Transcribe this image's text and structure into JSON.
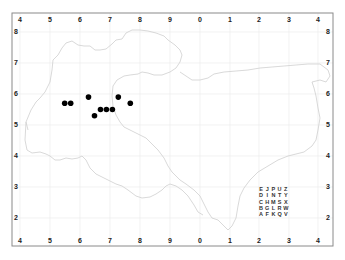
{
  "map": {
    "x_ticks": [
      "4",
      "5",
      "6",
      "7",
      "8",
      "9",
      "0",
      "1",
      "2",
      "3",
      "4"
    ],
    "y_ticks": [
      "8",
      "7",
      "6",
      "5",
      "4",
      "3",
      "2"
    ],
    "colors": {
      "frame": "#8a8a8a",
      "grid": "#ececec",
      "coastline": "#cfcfcf",
      "points": "#000000"
    },
    "points": [
      {
        "x": 5.5,
        "y": 5.7
      },
      {
        "x": 5.7,
        "y": 5.7
      },
      {
        "x": 6.3,
        "y": 5.9
      },
      {
        "x": 6.5,
        "y": 5.3
      },
      {
        "x": 6.7,
        "y": 5.5
      },
      {
        "x": 6.9,
        "y": 5.5
      },
      {
        "x": 7.1,
        "y": 5.5
      },
      {
        "x": 7.3,
        "y": 5.9
      },
      {
        "x": 7.7,
        "y": 5.7
      }
    ],
    "key_grid": [
      [
        "E",
        "J",
        "P",
        "U",
        "Z"
      ],
      [
        "D",
        "I",
        "N",
        "T",
        "Y"
      ],
      [
        "C",
        "H",
        "M",
        "S",
        "X"
      ],
      [
        "B",
        "G",
        "L",
        "R",
        "W"
      ],
      [
        "A",
        "F",
        "K",
        "Q",
        "V"
      ]
    ]
  }
}
